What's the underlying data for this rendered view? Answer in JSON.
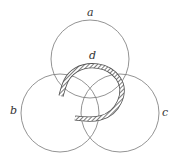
{
  "diagram": {
    "type": "venn-three-circles-with-curve",
    "colors": {
      "stroke": "#777777",
      "band": "#555555",
      "background": "#ffffff"
    },
    "circles": [
      {
        "id": "a",
        "label": "a",
        "cx": 90,
        "cy": 59,
        "r": 39,
        "label_x": 90,
        "label_y": 16
      },
      {
        "id": "b",
        "label": "b",
        "cx": 60,
        "cy": 113,
        "r": 39,
        "label_x": 13,
        "label_y": 113
      },
      {
        "id": "c",
        "label": "c",
        "cx": 120,
        "cy": 113,
        "r": 39,
        "label_x": 164,
        "label_y": 116
      }
    ],
    "curve": {
      "id": "d",
      "label": "d",
      "label_x": 92,
      "label_y": 58
    }
  }
}
